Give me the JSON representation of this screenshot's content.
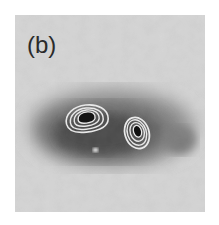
{
  "figure": {
    "panel_label": "(b)",
    "colormap": "grayscale",
    "background_gray": "#d4d4d4",
    "extended_emission": {
      "center": [
        100,
        135
      ],
      "size": [
        155,
        75
      ],
      "peak_gray": "#4a4a4a"
    },
    "contours": [
      {
        "name": "left-source",
        "center": [
          87,
          118
        ],
        "rx": 21,
        "ry": 14,
        "levels": 4,
        "rotation": -8,
        "core_gray": "#101010"
      },
      {
        "name": "right-source",
        "center": [
          137,
          133
        ],
        "rx": 12,
        "ry": 15,
        "levels": 4,
        "rotation": -15,
        "core_gray": "#101010"
      }
    ],
    "contour_color": "#e8e8e8",
    "marker": {
      "position": [
        95,
        150
      ],
      "color": "#ececec"
    }
  }
}
